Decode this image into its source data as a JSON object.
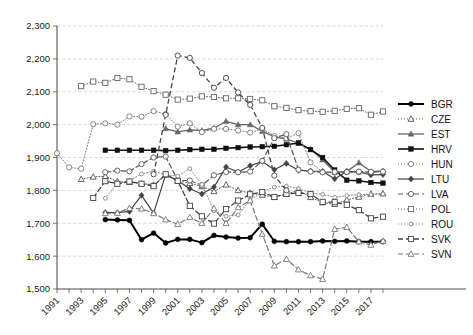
{
  "chart_data": {
    "type": "line",
    "title": "",
    "subtitle": "",
    "xlabel": "",
    "ylabel": "",
    "xlim": [
      1991,
      2018
    ],
    "ylim": [
      1500,
      2300
    ],
    "yticks": [
      "1,500",
      "1,600",
      "1,700",
      "1,800",
      "1,900",
      "2,000",
      "2,100",
      "2,200",
      "2,300"
    ],
    "ytick_values": [
      1500,
      1600,
      1700,
      1800,
      1900,
      2000,
      2100,
      2200,
      2300
    ],
    "xticks": [
      "1991",
      "1993",
      "1995",
      "1997",
      "1999",
      "2001",
      "2003",
      "2005",
      "2007",
      "2009",
      "2011",
      "2013",
      "2015",
      "2017"
    ],
    "xtick_values": [
      1991,
      1993,
      1995,
      1997,
      1999,
      2001,
      2003,
      2005,
      2007,
      2009,
      2011,
      2013,
      2015,
      2017
    ],
    "x": [
      1991,
      1992,
      1993,
      1994,
      1995,
      1996,
      1997,
      1998,
      1999,
      2000,
      2001,
      2002,
      2003,
      2004,
      2005,
      2006,
      2007,
      2008,
      2009,
      2010,
      2011,
      2012,
      2013,
      2014,
      2015,
      2016,
      2017,
      2018
    ],
    "grid": true,
    "legend_position": "right",
    "series": [
      {
        "name": "BGR",
        "marker": "filled-circle",
        "line": "solid",
        "color": "#000000",
        "width": 2.0,
        "x": [
          1995,
          1996,
          1997,
          1998,
          1999,
          2000,
          2001,
          2002,
          2003,
          2004,
          2005,
          2006,
          2007,
          2008,
          2009,
          2010,
          2011,
          2012,
          2013,
          2014,
          2015,
          2016,
          2017,
          2018
        ],
        "values": [
          1711,
          1710,
          1709,
          1650,
          1670,
          1640,
          1651,
          1651,
          1641,
          1663,
          1658,
          1655,
          1656,
          1697,
          1645,
          1644,
          1644,
          1644,
          1646,
          1645,
          1646,
          1644,
          1644,
          1644
        ]
      },
      {
        "name": "CZE",
        "marker": "open-triangle",
        "line": "dotted",
        "color": "#555555",
        "width": 1.0,
        "x": [
          1993,
          1994,
          1995,
          1996,
          1997,
          1998,
          1999,
          2000,
          2001,
          2002,
          2003,
          2004,
          2005,
          2006,
          2007,
          2008,
          2009,
          2010,
          2011,
          2012,
          2013,
          2014,
          2015,
          2016,
          2017,
          2018
        ],
        "values": [
          1834,
          1841,
          1843,
          1827,
          1825,
          1821,
          1817,
          1847,
          1829,
          1822,
          1812,
          1797,
          1817,
          1800,
          1792,
          1786,
          1779,
          1789,
          1800,
          1779,
          1763,
          1758,
          1771,
          1780,
          1789,
          1790
        ]
      },
      {
        "name": "EST",
        "marker": "filled-triangle",
        "line": "solid",
        "color": "#666666",
        "width": 1.3,
        "x": [
          2000,
          2001,
          2002,
          2003,
          2004,
          2005,
          2006,
          2007,
          2008,
          2009,
          2010,
          2011,
          2012,
          2013,
          2014,
          2015,
          2016,
          2017,
          2018
        ],
        "values": [
          1988,
          1978,
          1984,
          1982,
          1989,
          2010,
          2000,
          2000,
          1980,
          1963,
          1956,
          1944,
          1925,
          1893,
          1855,
          1857,
          1884,
          1857,
          1859
        ]
      },
      {
        "name": "HRV",
        "marker": "filled-square",
        "line": "solid",
        "color": "#111111",
        "width": 1.6,
        "x": [
          1995,
          1996,
          1997,
          1998,
          1999,
          2000,
          2001,
          2002,
          2003,
          2004,
          2005,
          2006,
          2007,
          2008,
          2009,
          2010,
          2011,
          2012,
          2013,
          2014,
          2015,
          2016,
          2017,
          2018
        ],
        "values": [
          1922,
          1922,
          1922,
          1922,
          1922,
          1921,
          1922,
          1924,
          1925,
          1925,
          1928,
          1930,
          1932,
          1933,
          1934,
          1939,
          1944,
          1924,
          1900,
          1862,
          1831,
          1829,
          1824,
          1822
        ]
      },
      {
        "name": "HUN",
        "marker": "open-circle",
        "line": "dotted",
        "color": "#777777",
        "width": 1.0,
        "x": [
          1991,
          1992,
          1993,
          1994,
          1995,
          1996,
          1997,
          1998,
          1999,
          2000,
          2001,
          2002,
          2003,
          2004,
          2005,
          2006,
          2007,
          2008,
          2009,
          2010,
          2011,
          2012,
          2013,
          2014,
          2015,
          2016,
          2017,
          2018
        ],
        "values": [
          1913,
          1870,
          1866,
          2001,
          2004,
          2000,
          2025,
          2024,
          2041,
          2032,
          1994,
          2004,
          1977,
          1987,
          1987,
          1982,
          1976,
          1987,
          1965,
          1959,
          1974,
          1885,
          1856,
          1854,
          1856,
          1855,
          1855,
          1857
        ]
      },
      {
        "name": "LTU",
        "marker": "filled-diamond",
        "line": "solid",
        "color": "#444444",
        "width": 1.2,
        "x": [
          1995,
          1996,
          1997,
          1998,
          1999,
          2000,
          2001,
          2002,
          2003,
          2004,
          2005,
          2006,
          2007,
          2008,
          2009,
          2010,
          2011,
          2012,
          2013,
          2014,
          2015,
          2016,
          2017,
          2018
        ],
        "values": [
          1733,
          1732,
          1736,
          1785,
          1731,
          1848,
          1830,
          1805,
          1789,
          1810,
          1871,
          1856,
          1875,
          1888,
          1863,
          1882,
          1861,
          1859,
          1858,
          1835,
          1858,
          1856,
          1847,
          1848
        ]
      },
      {
        "name": "LVA",
        "marker": "open-circle",
        "line": "dashed",
        "color": "#555555",
        "width": 1.2,
        "x": [
          1995,
          1996,
          1997,
          1998,
          1999,
          2000,
          2001,
          2002,
          2003,
          2004,
          2005,
          2006,
          2007,
          2008,
          2009,
          2010,
          2011,
          2012,
          2013,
          2014,
          2015,
          2016,
          2017,
          2018
        ],
        "values": [
          1855,
          1860,
          1858,
          1880,
          1900,
          1903,
          1830,
          1830,
          1815,
          1846,
          1856,
          1855,
          1857,
          1890,
          1959,
          1971,
          1863,
          1857,
          1855,
          1856,
          1856,
          1857,
          1856,
          1857
        ]
      },
      {
        "name": "POL",
        "marker": "open-square",
        "line": "dotted",
        "color": "#666666",
        "width": 1.0,
        "x": [
          1993,
          1994,
          1995,
          1996,
          1997,
          1998,
          1999,
          2000,
          2001,
          2002,
          2003,
          2004,
          2005,
          2006,
          2007,
          2008,
          2009,
          2010,
          2011,
          2012,
          2013,
          2014,
          2015,
          2016,
          2017,
          2018
        ],
        "values": [
          2117,
          2131,
          2127,
          2142,
          2138,
          2115,
          2102,
          2091,
          2076,
          2079,
          2086,
          2084,
          2080,
          2080,
          2078,
          2074,
          2056,
          2051,
          2044,
          2041,
          2039,
          2042,
          2048,
          2050,
          2030,
          2040
        ]
      },
      {
        "name": "ROU",
        "marker": "open-circle-small",
        "line": "dotted",
        "color": "#888888",
        "width": 1.0,
        "x": [
          1995,
          1996,
          1997,
          1998,
          1999,
          2000,
          2001,
          2002,
          2003,
          2004,
          2005,
          2006,
          2007,
          2008,
          2009,
          2010,
          2011,
          2012,
          2013,
          2014,
          2015,
          2016,
          2017,
          2018
        ],
        "values": [
          1776,
          1822,
          1829,
          1850,
          1858,
          1848,
          1843,
          1866,
          1818,
          1738,
          1721,
          1725,
          1771,
          1796,
          1810,
          1813,
          1806,
          1791,
          1788,
          1779,
          1784,
          1787,
          1787,
          1789
        ]
      },
      {
        "name": "SVK",
        "marker": "open-square",
        "line": "dashed",
        "color": "#444444",
        "width": 1.3,
        "x": [
          1994,
          1995,
          1996,
          1997,
          1998,
          1999,
          2000,
          2001,
          2002,
          2003,
          2004,
          2005,
          2006,
          2007,
          2008,
          2009,
          2010,
          2011,
          2012,
          2013,
          2014,
          2015,
          2016,
          2017,
          2018
        ],
        "values": [
          1777,
          1828,
          1820,
          1827,
          1820,
          1813,
          1849,
          1829,
          1753,
          1721,
          1699,
          1743,
          1769,
          1788,
          1795,
          1780,
          1789,
          1792,
          1789,
          1765,
          1764,
          1756,
          1740,
          1715,
          1720
        ]
      },
      {
        "name": "SVN",
        "marker": "open-triangle",
        "line": "dashed",
        "color": "#777777",
        "width": 1.2,
        "x": [
          1995,
          1996,
          1997,
          1998,
          1999,
          2000,
          2001,
          2002,
          2003,
          2004,
          2005,
          2006,
          2007,
          2008,
          2009,
          2010,
          2011,
          2012,
          2013,
          2014,
          2015,
          2016,
          2017,
          2018
        ],
        "values": [
          1730,
          1731,
          1746,
          1744,
          1730,
          1711,
          1697,
          1718,
          1700,
          1745,
          1700,
          1748,
          1769,
          1667,
          1571,
          1591,
          1559,
          1541,
          1530,
          1682,
          1688,
          1644,
          1634,
          1646
        ]
      }
    ],
    "peak_series": [
      {
        "name": "SVK",
        "peak_year": 2001,
        "peak_value": 2210
      }
    ]
  },
  "legend": {
    "items": [
      "BGR",
      "CZE",
      "EST",
      "HRV",
      "HUN",
      "LTU",
      "LVA",
      "POL",
      "ROU",
      "SVK",
      "SVN"
    ]
  }
}
